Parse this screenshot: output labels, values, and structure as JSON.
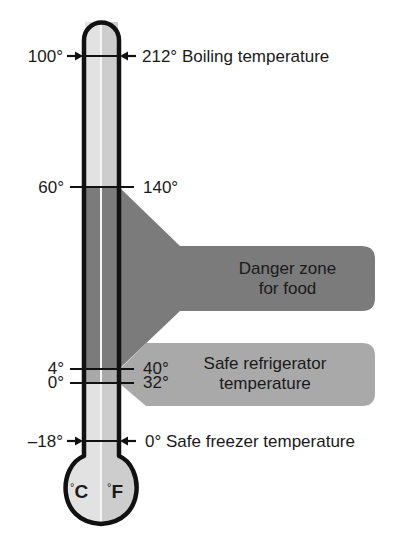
{
  "colors": {
    "outline": "#111111",
    "tube_left": "#e2e2e2",
    "tube_right": "#cdcdcd",
    "center_line": "#f5f5f5",
    "danger_fill": "#7b7b7b",
    "fridge_fill": "#a9a9a9",
    "text": "#1a1a1a"
  },
  "marks": [
    {
      "id": "boiling",
      "celsius": "100°",
      "fahrenheit": "212°",
      "description": "Boiling temperature",
      "style": "arrows"
    },
    {
      "id": "danger-top",
      "celsius": "60°",
      "fahrenheit": "140°",
      "description": "",
      "style": "tick"
    },
    {
      "id": "fridge-top",
      "celsius": "4°",
      "fahrenheit": "40°",
      "description": "",
      "style": "tick"
    },
    {
      "id": "freezing",
      "celsius": "0°",
      "fahrenheit": "32°",
      "description": "",
      "style": "tick"
    },
    {
      "id": "freezer",
      "celsius": "–18°",
      "fahrenheit": "0°",
      "description": "Safe freezer temperature",
      "style": "arrows"
    }
  ],
  "zones": {
    "danger": {
      "line1": "Danger zone",
      "line2": "for food",
      "range_c": "4°–60°",
      "range_f": "40°–140°"
    },
    "fridge": {
      "line1": "Safe refrigerator",
      "line2": "temperature",
      "range_c": "0°–4°",
      "range_f": "32°–40°"
    }
  },
  "units": {
    "left": "C",
    "right": "F",
    "degree": "°"
  }
}
